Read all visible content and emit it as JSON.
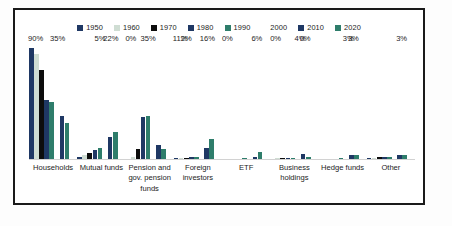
{
  "chart_data": {
    "type": "bar",
    "title": "",
    "subtitle": "",
    "xlabel": "",
    "ylabel": "",
    "grid": false,
    "legend_position": "top",
    "ylim": [
      0,
      95
    ],
    "categories": [
      "Households",
      "Mutual funds",
      "Pension and gov. pension funds",
      "Foreign investors",
      "ETF",
      "Business holdings",
      "Hedge funds",
      "Other"
    ],
    "category_lines": [
      [
        "Households"
      ],
      [
        "Mutual funds"
      ],
      [
        "Pension and",
        "gov. pension",
        "funds"
      ],
      [
        "Foreign",
        "investors"
      ],
      [
        "ETF"
      ],
      [
        "Business",
        "holdings"
      ],
      [
        "Hedge funds"
      ],
      [
        "Other"
      ]
    ],
    "series": [
      {
        "name": "1950",
        "color": "#1f3864",
        "values": [
          90,
          2,
          0,
          1,
          0,
          0,
          0,
          1
        ]
      },
      {
        "name": "1960",
        "color": "#cfddd3",
        "values": [
          85,
          3,
          2,
          1,
          0,
          1,
          0,
          1
        ]
      },
      {
        "name": "1970",
        "color": "#0d0d0d",
        "values": [
          72,
          5,
          8,
          1,
          0,
          1,
          0,
          2
        ]
      },
      {
        "name": "1980",
        "color": "#1f3864",
        "values": [
          48,
          7,
          34,
          2,
          0,
          1,
          0,
          2
        ]
      },
      {
        "name": "1990",
        "color": "#2e7d6b",
        "values": [
          46,
          9,
          35,
          2,
          1,
          1,
          1,
          2
        ]
      },
      {
        "name": "2000",
        "color": "#ffffff",
        "values": [
          0,
          0,
          0,
          0,
          0,
          0,
          0,
          0
        ]
      },
      {
        "name": "2010",
        "color": "#1f3864",
        "values": [
          35,
          18,
          11,
          9,
          2,
          4,
          3,
          3
        ]
      },
      {
        "name": "2020",
        "color": "#2e7d6b",
        "values": [
          29,
          22,
          8,
          16,
          6,
          2,
          3,
          3
        ]
      }
    ],
    "value_labels": [
      {
        "category": "Households",
        "series": "1950",
        "text": "90%"
      },
      {
        "category": "Households",
        "series": "2010",
        "text": "35%"
      },
      {
        "category": "Mutual funds",
        "series": "1990",
        "text": "5%"
      },
      {
        "category": "Mutual funds",
        "series": "2020",
        "text": "22%"
      },
      {
        "category": "Pension and gov. pension funds",
        "series": "1950",
        "text": "0%"
      },
      {
        "category": "Pension and gov. pension funds",
        "series": "1990",
        "text": "35%"
      },
      {
        "category": "Foreign investors",
        "series": "1950",
        "text": "11%"
      },
      {
        "category": "Foreign investors",
        "series": "1970",
        "text": "2%"
      },
      {
        "category": "Foreign investors",
        "series": "2020",
        "text": "16%"
      },
      {
        "category": "ETF",
        "series": "1950",
        "text": "0%"
      },
      {
        "category": "ETF",
        "series": "2020",
        "text": "6%"
      },
      {
        "category": "Business holdings",
        "series": "1950",
        "text": "0%"
      },
      {
        "category": "Business holdings",
        "series": "2010",
        "text": "4%"
      },
      {
        "category": "Business holdings",
        "series": "2020",
        "text": "0%"
      },
      {
        "category": "Hedge funds",
        "series": "2010",
        "text": "3%"
      },
      {
        "category": "Hedge funds",
        "series": "2020",
        "text": "3%"
      },
      {
        "category": "Other",
        "series": "2020",
        "text": "3%"
      }
    ]
  },
  "legend": {
    "items": [
      {
        "label": "1950",
        "color": "#1f3864"
      },
      {
        "label": "1960",
        "color": "#cfddd3"
      },
      {
        "label": "1970",
        "color": "#0d0d0d"
      },
      {
        "label": "1980",
        "color": "#1f3864"
      },
      {
        "label": "1990",
        "color": "#2e7d6b"
      },
      {
        "label": "2000",
        "color": "#ffffff"
      },
      {
        "label": "2010",
        "color": "#1f3864"
      },
      {
        "label": "2020",
        "color": "#2e7d6b"
      }
    ]
  },
  "style": {
    "frame_color": "#1a1a1a",
    "background": "#ffffff",
    "axis_color": "#d2d2d2",
    "text_color": "#1c1c1c"
  }
}
